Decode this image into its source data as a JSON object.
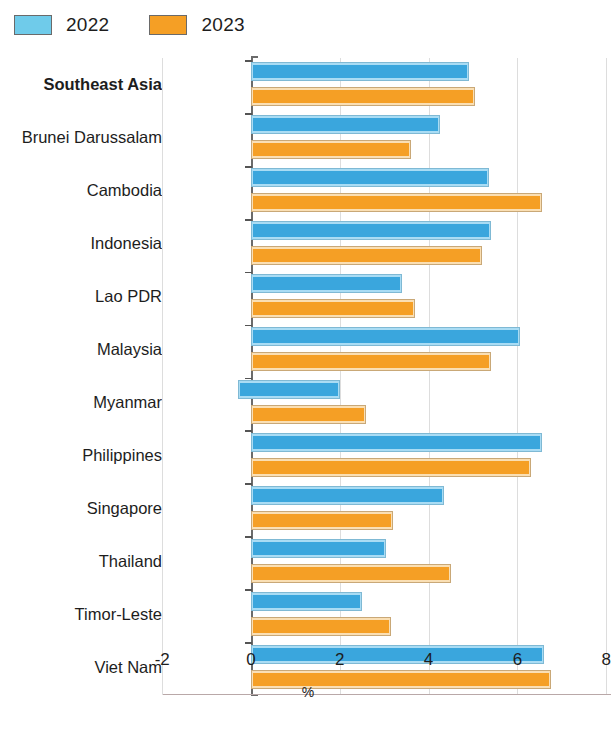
{
  "legend": {
    "items": [
      {
        "label": "2022",
        "color": "#6fcbea",
        "name": "legend-2022"
      },
      {
        "label": "2023",
        "color": "#f59f25",
        "name": "legend-2023"
      }
    ]
  },
  "axis": {
    "xlabel": "%",
    "ticks": [
      "-2",
      "0",
      "2",
      "4",
      "6",
      "8"
    ],
    "tick_values": [
      -2,
      0,
      2,
      4,
      6,
      8
    ],
    "xmin": -2.6,
    "xmax": 8.1
  },
  "chart_data": {
    "type": "bar",
    "orientation": "horizontal",
    "title": "",
    "subtitle": "",
    "xlabel": "%",
    "ylabel": "",
    "xlim": [
      -2.6,
      8.1
    ],
    "grid": true,
    "legend_position": "top-left",
    "categories": [
      "Southeast Asia",
      "Brunei Darussalam",
      "Cambodia",
      "Indonesia",
      "Lao PDR",
      "Malaysia",
      "Myanmar",
      "Philippines",
      "Singapore",
      "Thailand",
      "Timor-Leste",
      "Viet Nam"
    ],
    "bold_categories": [
      "Southeast Asia"
    ],
    "series": [
      {
        "name": "2022",
        "color": "#6fcbea",
        "values": [
          4.9,
          4.25,
          5.35,
          5.4,
          3.4,
          6.05,
          2.0,
          6.55,
          4.35,
          3.05,
          2.5,
          6.6
        ],
        "starts": [
          0,
          0,
          0,
          0,
          0,
          0,
          -0.3,
          0,
          0,
          0,
          0,
          0
        ]
      },
      {
        "name": "2023",
        "color": "#f59f25",
        "values": [
          5.05,
          3.6,
          6.55,
          5.2,
          3.7,
          5.4,
          2.6,
          6.3,
          3.2,
          4.5,
          3.15,
          6.75
        ],
        "starts": [
          0,
          0,
          0,
          0,
          0,
          0,
          0,
          0,
          0,
          0,
          0,
          0
        ]
      }
    ]
  }
}
